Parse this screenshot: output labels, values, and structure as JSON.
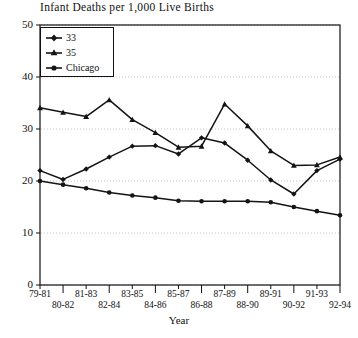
{
  "chart_data": {
    "type": "line",
    "title": "Infant Deaths per 1,000 Live Births",
    "xlabel": "Year",
    "ylabel": "",
    "ylim": [
      0,
      50
    ],
    "yticks": [
      0,
      10,
      20,
      30,
      40,
      50
    ],
    "grid": true,
    "legend_position": "top-left",
    "categories": [
      "79-81",
      "80-82",
      "81-83",
      "82-84",
      "83-85",
      "84-86",
      "85-87",
      "86-88",
      "87-89",
      "88-90",
      "89-91",
      "90-92",
      "91-93",
      "92-94"
    ],
    "series": [
      {
        "name": "33",
        "marker": "diamond",
        "values": [
          22.0,
          20.3,
          22.3,
          24.6,
          26.7,
          26.8,
          25.2,
          28.3,
          27.3,
          24.0,
          20.2,
          17.5,
          22.0,
          24.2
        ]
      },
      {
        "name": "35",
        "marker": "triangle",
        "values": [
          34.1,
          33.2,
          32.4,
          35.6,
          31.8,
          29.3,
          26.5,
          26.7,
          34.8,
          30.6,
          25.8,
          23.0,
          23.1,
          24.6
        ]
      },
      {
        "name": "Chicago",
        "marker": "circle",
        "values": [
          20.0,
          19.3,
          18.6,
          17.8,
          17.2,
          16.8,
          16.2,
          16.1,
          16.1,
          16.1,
          15.9,
          15.0,
          14.2,
          13.4
        ]
      }
    ]
  },
  "axis": {
    "ytick_labels": [
      "50",
      "40",
      "30",
      "20",
      "10",
      "0"
    ],
    "xtick_labels": [
      "79-81",
      "80-82",
      "81-83",
      "82-84",
      "83-85",
      "84-86",
      "85-87",
      "86-88",
      "87-89",
      "88-90",
      "89-91",
      "90-92",
      "91-93",
      "92-94"
    ],
    "xlabel": "Year"
  },
  "legend": {
    "entries": [
      {
        "label": "33"
      },
      {
        "label": "35"
      },
      {
        "label": "Chicago"
      }
    ]
  },
  "colors": {
    "line": "#141414",
    "frame": "#111111",
    "grid": "#b8b8b8",
    "background": "#ffffff"
  }
}
